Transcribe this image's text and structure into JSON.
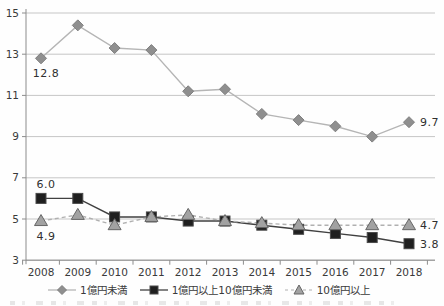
{
  "chart_data": {
    "type": "line",
    "x": [
      2008,
      2009,
      2010,
      2011,
      2012,
      2013,
      2014,
      2015,
      2016,
      2017,
      2018
    ],
    "series": [
      {
        "name": "1億円未満",
        "marker": "diamond",
        "line": "solid",
        "values": [
          12.8,
          14.4,
          13.3,
          13.2,
          11.2,
          11.3,
          10.1,
          9.8,
          9.5,
          9.0,
          9.7
        ]
      },
      {
        "name": "1億円以上10億円未満",
        "marker": "square",
        "line": "solid",
        "values": [
          6.0,
          6.0,
          5.1,
          5.1,
          4.9,
          4.9,
          4.7,
          4.5,
          4.3,
          4.1,
          3.8
        ]
      },
      {
        "name": "10億円以上",
        "marker": "triangle",
        "line": "dashed",
        "values": [
          4.9,
          5.2,
          4.7,
          5.1,
          5.2,
          4.9,
          4.8,
          4.7,
          4.7,
          4.7,
          4.7
        ]
      }
    ],
    "title": "",
    "xlabel": "",
    "ylabel": "",
    "ylim": [
      3,
      15
    ],
    "yticks": [
      3,
      5,
      7,
      9,
      11,
      13,
      15
    ],
    "grid": true,
    "legend_position": "bottom",
    "point_labels": [
      {
        "series": 0,
        "point": 0,
        "text": "12.8",
        "placement": "below"
      },
      {
        "series": 0,
        "point": 10,
        "text": "9.7",
        "placement": "right"
      },
      {
        "series": 1,
        "point": 0,
        "text": "6.0",
        "placement": "above"
      },
      {
        "series": 1,
        "point": 10,
        "text": "3.8",
        "placement": "right"
      },
      {
        "series": 2,
        "point": 0,
        "text": "4.9",
        "placement": "below"
      },
      {
        "series": 2,
        "point": 10,
        "text": "4.7",
        "placement": "right"
      }
    ],
    "colors": {
      "grid": "#c6c6c6",
      "axis": "#8c8c8c",
      "text": "#3a3a3a",
      "lines": [
        "#b5b5b5",
        "#404040",
        "#b0b0b0"
      ],
      "fills": [
        "#8f8f8f",
        "#1f1f1f",
        "#a2a2a2"
      ],
      "strokes": [
        "#7f7f7f",
        "#4a4a4a",
        "#666666"
      ]
    }
  }
}
